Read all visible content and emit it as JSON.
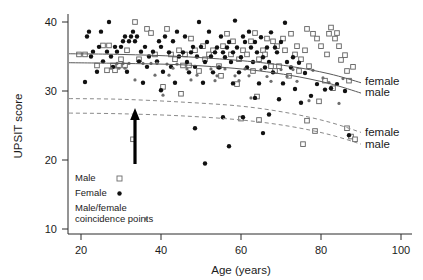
{
  "chart_data": {
    "type": "scatter",
    "title": "",
    "xlabel": "Age (years)",
    "ylabel": "UPSIT score",
    "xlim": [
      13,
      103
    ],
    "ylim": [
      8.5,
      42
    ],
    "xticks": [
      20,
      40,
      60,
      80,
      100
    ],
    "yticks": [
      10,
      20,
      30,
      40
    ],
    "grid": false,
    "legend_position": "bottom-left",
    "annotations": [
      {
        "name": "upward-arrow",
        "kind": "arrow",
        "x": 30,
        "y_from": 20.3,
        "y_to": 26.9,
        "direction": "up"
      }
    ],
    "series": [
      {
        "name": "Male",
        "marker": "open-square",
        "color": "#ffffff",
        "edge_color": "#5f5f5f",
        "points": [
          [
            33.5,
            40.0
          ],
          [
            36.5,
            39.0
          ],
          [
            41.5,
            39.0
          ],
          [
            76.5,
            39.0
          ],
          [
            82.5,
            39.2
          ],
          [
            84.0,
            38.4
          ],
          [
            37.5,
            38.4
          ],
          [
            63.5,
            38.4
          ],
          [
            72.5,
            38.3
          ],
          [
            78.0,
            38.3
          ],
          [
            82.0,
            38.3
          ],
          [
            56.5,
            38.3
          ],
          [
            66.5,
            37.6
          ],
          [
            70.5,
            37.6
          ],
          [
            79.0,
            37.6
          ],
          [
            83.5,
            37.6
          ],
          [
            47.5,
            37.6
          ],
          [
            58.0,
            37.2
          ],
          [
            62.5,
            37.2
          ],
          [
            68.0,
            37.2
          ],
          [
            25.5,
            36.6
          ],
          [
            27.0,
            36.6
          ],
          [
            50.5,
            36.5
          ],
          [
            55.5,
            36.5
          ],
          [
            69.0,
            36.5
          ],
          [
            74.0,
            36.5
          ],
          [
            80.0,
            36.5
          ],
          [
            84.5,
            36.5
          ],
          [
            31.5,
            35.9
          ],
          [
            44.5,
            35.9
          ],
          [
            48.5,
            35.9
          ],
          [
            53.0,
            35.9
          ],
          [
            60.5,
            35.9
          ],
          [
            65.5,
            35.9
          ],
          [
            71.0,
            35.9
          ],
          [
            76.0,
            35.9
          ],
          [
            19.5,
            35.3
          ],
          [
            21.0,
            35.3
          ],
          [
            38.5,
            35.3
          ],
          [
            42.5,
            35.3
          ],
          [
            46.0,
            35.3
          ],
          [
            52.0,
            35.3
          ],
          [
            57.5,
            35.3
          ],
          [
            61.5,
            35.3
          ],
          [
            66.0,
            35.3
          ],
          [
            73.5,
            35.3
          ],
          [
            81.5,
            35.3
          ],
          [
            86.0,
            35.2
          ],
          [
            30.0,
            34.6
          ],
          [
            34.5,
            34.6
          ],
          [
            43.5,
            34.6
          ],
          [
            51.0,
            34.6
          ],
          [
            59.5,
            34.6
          ],
          [
            64.5,
            34.6
          ],
          [
            75.0,
            34.6
          ],
          [
            85.0,
            34.5
          ],
          [
            24.0,
            33.7
          ],
          [
            28.0,
            33.7
          ],
          [
            29.5,
            33.7
          ],
          [
            31.0,
            33.7
          ],
          [
            45.5,
            33.7
          ],
          [
            47.0,
            33.7
          ],
          [
            54.5,
            33.6
          ],
          [
            67.5,
            33.6
          ],
          [
            69.5,
            33.6
          ],
          [
            77.0,
            33.6
          ],
          [
            88.0,
            33.5
          ],
          [
            26.5,
            33.0
          ],
          [
            28.5,
            33.0
          ],
          [
            49.5,
            32.9
          ],
          [
            63.0,
            32.9
          ],
          [
            68.5,
            32.9
          ],
          [
            74.5,
            32.9
          ],
          [
            86.5,
            32.9
          ],
          [
            55.0,
            32.2
          ],
          [
            72.0,
            32.2
          ],
          [
            81.0,
            31.5
          ],
          [
            87.0,
            31.5
          ],
          [
            59.0,
            31.0
          ],
          [
            83.0,
            30.4
          ],
          [
            40.5,
            30.6
          ],
          [
            45.0,
            29.6
          ],
          [
            64.0,
            29.2
          ],
          [
            79.5,
            28.5
          ],
          [
            33.0,
            23.0
          ],
          [
            60.0,
            26.0
          ],
          [
            64.5,
            25.8
          ],
          [
            76.5,
            25.7
          ],
          [
            78.5,
            24.2
          ],
          [
            86.5,
            24.6
          ],
          [
            87.5,
            23.4
          ],
          [
            88.5,
            23.0
          ],
          [
            75.5,
            22.3
          ]
        ]
      },
      {
        "name": "Female",
        "marker": "filled-dot",
        "color": "#111111",
        "points": [
          [
            27.0,
            40.0
          ],
          [
            49.5,
            40.0
          ],
          [
            58.5,
            40.2
          ],
          [
            71.0,
            39.9
          ],
          [
            22.0,
            38.6
          ],
          [
            25.0,
            38.6
          ],
          [
            33.0,
            38.6
          ],
          [
            44.0,
            38.6
          ],
          [
            52.0,
            38.6
          ],
          [
            62.0,
            38.6
          ],
          [
            67.5,
            38.5
          ],
          [
            21.5,
            37.9
          ],
          [
            31.0,
            37.9
          ],
          [
            32.5,
            37.9
          ],
          [
            34.0,
            37.9
          ],
          [
            41.0,
            37.9
          ],
          [
            46.0,
            37.9
          ],
          [
            55.0,
            37.9
          ],
          [
            60.5,
            37.9
          ],
          [
            65.0,
            37.8
          ],
          [
            30.5,
            37.2
          ],
          [
            32.0,
            37.2
          ],
          [
            33.5,
            37.2
          ],
          [
            39.5,
            37.2
          ],
          [
            43.0,
            37.2
          ],
          [
            51.5,
            37.1
          ],
          [
            57.0,
            37.1
          ],
          [
            61.0,
            37.1
          ],
          [
            63.5,
            37.1
          ],
          [
            70.0,
            37.1
          ],
          [
            24.5,
            36.4
          ],
          [
            28.5,
            36.4
          ],
          [
            30.0,
            36.4
          ],
          [
            36.0,
            36.4
          ],
          [
            40.0,
            36.4
          ],
          [
            48.0,
            36.4
          ],
          [
            50.0,
            36.4
          ],
          [
            54.0,
            36.3
          ],
          [
            56.5,
            36.3
          ],
          [
            59.0,
            36.3
          ],
          [
            62.5,
            36.3
          ],
          [
            66.5,
            36.3
          ],
          [
            68.5,
            36.3
          ],
          [
            23.0,
            35.7
          ],
          [
            26.5,
            35.7
          ],
          [
            29.0,
            35.7
          ],
          [
            35.0,
            35.7
          ],
          [
            38.0,
            35.7
          ],
          [
            42.0,
            35.6
          ],
          [
            45.5,
            35.6
          ],
          [
            47.5,
            35.6
          ],
          [
            53.5,
            35.6
          ],
          [
            55.5,
            35.6
          ],
          [
            58.0,
            35.6
          ],
          [
            64.0,
            35.6
          ],
          [
            69.0,
            35.6
          ],
          [
            22.5,
            35.0
          ],
          [
            27.5,
            35.0
          ],
          [
            37.0,
            35.0
          ],
          [
            44.5,
            35.0
          ],
          [
            49.0,
            35.0
          ],
          [
            52.5,
            35.0
          ],
          [
            56.0,
            34.9
          ],
          [
            60.0,
            34.9
          ],
          [
            65.5,
            34.9
          ],
          [
            73.0,
            34.9
          ],
          [
            25.5,
            34.3
          ],
          [
            34.5,
            34.3
          ],
          [
            39.0,
            34.3
          ],
          [
            46.5,
            34.2
          ],
          [
            51.0,
            34.2
          ],
          [
            57.5,
            34.2
          ],
          [
            63.0,
            34.2
          ],
          [
            67.0,
            34.2
          ],
          [
            71.5,
            34.2
          ],
          [
            74.5,
            34.1
          ],
          [
            28.0,
            33.5
          ],
          [
            36.5,
            33.5
          ],
          [
            42.5,
            33.5
          ],
          [
            48.5,
            33.5
          ],
          [
            54.5,
            33.4
          ],
          [
            61.5,
            33.4
          ],
          [
            66.0,
            33.4
          ],
          [
            72.5,
            33.4
          ],
          [
            24.0,
            32.8
          ],
          [
            31.5,
            32.8
          ],
          [
            40.5,
            32.8
          ],
          [
            47.0,
            32.7
          ],
          [
            53.0,
            32.7
          ],
          [
            59.5,
            32.7
          ],
          [
            68.0,
            32.7
          ],
          [
            76.0,
            32.6
          ],
          [
            21.0,
            31.3
          ],
          [
            35.5,
            31.2
          ],
          [
            43.5,
            31.2
          ],
          [
            50.5,
            31.2
          ],
          [
            58.0,
            31.1
          ],
          [
            64.5,
            31.1
          ],
          [
            70.5,
            31.1
          ],
          [
            79.0,
            31.0
          ],
          [
            73.5,
            30.3
          ],
          [
            81.0,
            30.2
          ],
          [
            86.0,
            30.0
          ],
          [
            77.5,
            29.3
          ],
          [
            63.5,
            29.0
          ],
          [
            69.5,
            28.8
          ],
          [
            75.0,
            28.3
          ],
          [
            67.0,
            26.6
          ],
          [
            82.5,
            30.4
          ],
          [
            84.0,
            31.0
          ],
          [
            55.5,
            26.2
          ],
          [
            60.5,
            26.2
          ],
          [
            48.5,
            24.6
          ],
          [
            65.5,
            23.9
          ],
          [
            57.0,
            22.0
          ],
          [
            51.0,
            19.5
          ],
          [
            87.0,
            23.6
          ],
          [
            40.0,
            30.1
          ]
        ]
      },
      {
        "name": "Male/female coincidence points",
        "marker": "small-dot",
        "color": "#6e6e6e",
        "points": [
          [
            29.0,
            34.0
          ],
          [
            30.5,
            34.0
          ],
          [
            32.0,
            34.0
          ],
          [
            35.5,
            34.0
          ],
          [
            37.5,
            34.0
          ],
          [
            39.0,
            34.0
          ],
          [
            41.5,
            33.9
          ],
          [
            44.0,
            33.9
          ],
          [
            27.5,
            33.3
          ],
          [
            29.5,
            33.3
          ],
          [
            31.0,
            33.3
          ],
          [
            43.0,
            33.3
          ],
          [
            46.5,
            33.2
          ],
          [
            52.5,
            33.2
          ],
          [
            56.0,
            33.2
          ],
          [
            61.0,
            33.2
          ],
          [
            65.0,
            33.1
          ],
          [
            70.0,
            33.1
          ],
          [
            73.0,
            33.1
          ],
          [
            78.0,
            33.0
          ],
          [
            38.5,
            32.3
          ],
          [
            42.0,
            32.3
          ],
          [
            49.0,
            32.3
          ],
          [
            54.0,
            32.2
          ],
          [
            58.5,
            32.2
          ],
          [
            62.0,
            32.2
          ],
          [
            66.5,
            32.1
          ],
          [
            71.5,
            32.1
          ],
          [
            80.5,
            31.9
          ],
          [
            85.5,
            31.8
          ],
          [
            33.5,
            31.6
          ],
          [
            47.5,
            31.6
          ],
          [
            53.5,
            31.5
          ],
          [
            59.5,
            31.5
          ],
          [
            67.5,
            31.4
          ],
          [
            74.0,
            31.4
          ],
          [
            82.0,
            31.2
          ],
          [
            40.5,
            29.4
          ],
          [
            62.5,
            29.0
          ],
          [
            77.0,
            28.6
          ],
          [
            84.5,
            28.2
          ]
        ]
      }
    ],
    "fit_curves": [
      {
        "name": "female-upper",
        "style": "solid",
        "label": "female",
        "label_x": 91,
        "label_y": 31.4,
        "points": [
          [
            17,
            35.4
          ],
          [
            30,
            35.3
          ],
          [
            45,
            35.0
          ],
          [
            60,
            34.4
          ],
          [
            72,
            33.6
          ],
          [
            82,
            32.5
          ],
          [
            90,
            31.2
          ]
        ]
      },
      {
        "name": "male-upper",
        "style": "solid",
        "label": "male",
        "label_x": 91,
        "label_y": 29.8,
        "points": [
          [
            17,
            34.1
          ],
          [
            30,
            34.0
          ],
          [
            45,
            33.8
          ],
          [
            60,
            33.2
          ],
          [
            72,
            32.3
          ],
          [
            82,
            31.1
          ],
          [
            90,
            29.7
          ]
        ]
      },
      {
        "name": "female-lower",
        "style": "dashed",
        "label": "female",
        "label_x": 91,
        "label_y": 24.0,
        "points": [
          [
            17,
            28.9
          ],
          [
            30,
            28.8
          ],
          [
            45,
            28.4
          ],
          [
            60,
            27.8
          ],
          [
            72,
            26.8
          ],
          [
            82,
            25.5
          ],
          [
            90,
            24.0
          ]
        ]
      },
      {
        "name": "male-lower",
        "style": "dashed",
        "label": "male",
        "label_x": 91,
        "label_y": 22.3,
        "points": [
          [
            17,
            26.8
          ],
          [
            30,
            26.7
          ],
          [
            45,
            26.4
          ],
          [
            60,
            25.8
          ],
          [
            72,
            24.9
          ],
          [
            82,
            23.7
          ],
          [
            90,
            22.3
          ]
        ]
      }
    ]
  },
  "legend": {
    "entries": [
      {
        "label": "Male",
        "marker": "open-square"
      },
      {
        "label": "Female",
        "marker": "filled-dot"
      },
      {
        "label": "Male/female",
        "label2": "coincidence points",
        "marker": "small-dot"
      }
    ]
  }
}
